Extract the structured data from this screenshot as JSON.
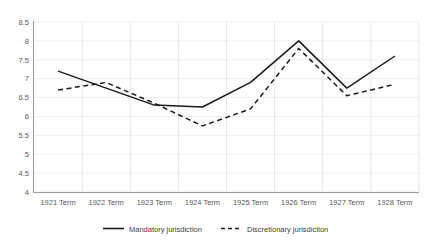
{
  "chart_data": {
    "type": "line",
    "title": "",
    "xlabel": "",
    "ylabel": "",
    "categories": [
      "1921 Term",
      "1922 Term",
      "1923 Term",
      "1924 Term",
      "1925 Term",
      "1926 Term",
      "1927 Term",
      "1928 Term"
    ],
    "series": [
      {
        "name": "Mandatory jurisdiction",
        "style": "solid",
        "color": "#1a1a1a",
        "values": [
          7.2,
          6.75,
          6.3,
          6.25,
          6.9,
          8.0,
          6.75,
          7.6
        ]
      },
      {
        "name": "Discretionary jurisdiction",
        "style": "dashed",
        "color": "#1a1a1a",
        "values": [
          6.7,
          6.9,
          6.35,
          5.75,
          6.2,
          7.8,
          6.55,
          6.85
        ]
      }
    ],
    "ylim": [
      4,
      8.5
    ],
    "ytick_labels": [
      "8.5",
      "8",
      "7.5",
      "7",
      "6.5",
      "6",
      "5.5",
      "5",
      "4.5",
      "4"
    ],
    "ytick_values": [
      8.5,
      8,
      7.5,
      7,
      6.5,
      6,
      5.5,
      5,
      4.5,
      4
    ],
    "grid": "horizontal-and-vertical",
    "legend_position": "bottom"
  },
  "legend": {
    "entries": [
      {
        "label": "Mandatory jurisdiction",
        "style": "solid"
      },
      {
        "label": "Discretionary jurisdiction",
        "style": "dashed"
      }
    ]
  },
  "axes": {
    "y_axis_name": "y-axis",
    "x_axis_name": "x-axis"
  }
}
